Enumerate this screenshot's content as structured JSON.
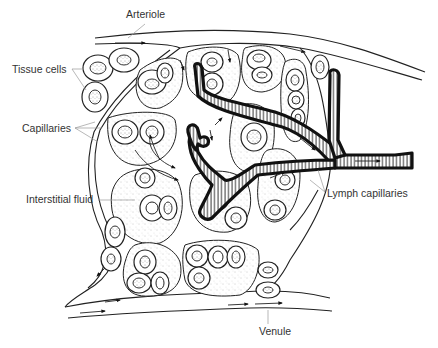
{
  "diagram": {
    "type": "anatomical line drawing",
    "labels": {
      "arteriole": "Arteriole",
      "tissue_cells": "Tissue cells",
      "capillaries": "Capillaries",
      "interstitial_fluid": "Interstitial fluid",
      "lymph_capillaries": "Lymph capillaries",
      "venule": "Venule"
    },
    "colors": {
      "line": "#222222",
      "label_text": "#333333",
      "leader_line": "#9a9a9a",
      "background": "#ffffff"
    }
  }
}
